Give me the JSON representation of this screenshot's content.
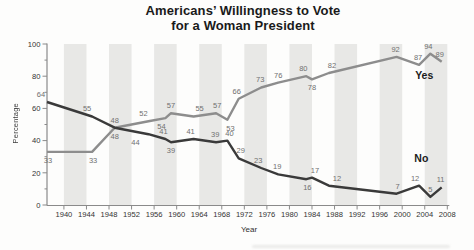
{
  "chart_data": {
    "type": "line",
    "title_lines": [
      "Americans’ Willingness to Vote",
      "for a Woman President"
    ],
    "xlabel": "Year",
    "ylabel": "Percentage",
    "x_range": [
      1937,
      2008
    ],
    "y_range": [
      0,
      100
    ],
    "x_ticks": [
      1940,
      1944,
      1948,
      1952,
      1956,
      1960,
      1964,
      1968,
      1972,
      1976,
      1980,
      1984,
      1988,
      1992,
      1996,
      2000,
      2004,
      2008
    ],
    "y_ticks": [
      0,
      20,
      40,
      60,
      80,
      100
    ],
    "y_minor_ticks": [
      10,
      30,
      50,
      70,
      90
    ],
    "grid": "none",
    "legend_position": "inline-right",
    "background_bands": {
      "color": "#e8e8e6",
      "width_years": 4,
      "start_years": [
        1940,
        1948,
        1956,
        1964,
        1972,
        1980,
        1988,
        1996,
        2004
      ]
    },
    "axis_color": "#8a8a8a",
    "series": [
      {
        "name": "Yes",
        "color": "#8d8d8d",
        "name_label": {
          "text": "Yes",
          "x": 2003.9,
          "y": 80.7
        },
        "points": [
          [
            1937,
            33,
            "below",
            1
          ],
          [
            1945,
            33,
            "below",
            1
          ],
          [
            1949,
            48,
            "below",
            0
          ],
          [
            1955,
            52,
            "above",
            -5
          ],
          [
            1958,
            54,
            "below",
            -4
          ],
          [
            1959,
            57,
            "above",
            0
          ],
          [
            1963,
            55,
            "above",
            6
          ],
          [
            1967,
            57,
            "above",
            1
          ],
          [
            1969,
            53,
            "below",
            3
          ],
          [
            1971,
            66,
            "above",
            -2
          ],
          [
            1975,
            73,
            "above",
            -1
          ],
          [
            1978,
            76,
            "above",
            0
          ],
          [
            1983,
            80,
            "above",
            -3
          ],
          [
            1984,
            78,
            "below",
            0
          ],
          [
            1987,
            82,
            "above",
            3
          ],
          [
            1999,
            92,
            "above",
            -1
          ],
          [
            2003,
            87,
            "above",
            -1
          ],
          [
            2005,
            94,
            "above",
            -2
          ],
          [
            2007,
            89,
            "above",
            -2
          ]
        ]
      },
      {
        "name": "No",
        "color": "#3a3a3a",
        "name_label": {
          "text": "No",
          "x": 2003.4,
          "y": 28.6
        },
        "points": [
          [
            1937,
            64,
            "above",
            -6
          ],
          [
            1945,
            55,
            "above",
            -5
          ],
          [
            1949,
            48,
            "above",
            0
          ],
          [
            1955,
            44,
            "below",
            -13
          ],
          [
            1958,
            41,
            "above",
            -2
          ],
          [
            1959,
            39,
            "below",
            0
          ],
          [
            1963,
            41,
            "above",
            -3
          ],
          [
            1967,
            39,
            "above",
            -1
          ],
          [
            1969,
            40,
            "above",
            2
          ],
          [
            1971,
            29,
            "above",
            2
          ],
          [
            1975,
            23,
            "above",
            -3
          ],
          [
            1978,
            19,
            "above",
            -1
          ],
          [
            1983,
            16,
            "below",
            1
          ],
          [
            1984,
            17,
            "above",
            3
          ],
          [
            1987,
            12,
            "above",
            8
          ],
          [
            1999,
            7,
            "above",
            1
          ],
          [
            2003,
            12,
            "above",
            -4
          ],
          [
            2005,
            5,
            "above",
            0
          ],
          [
            2007,
            11,
            "above",
            -1
          ]
        ]
      }
    ]
  }
}
